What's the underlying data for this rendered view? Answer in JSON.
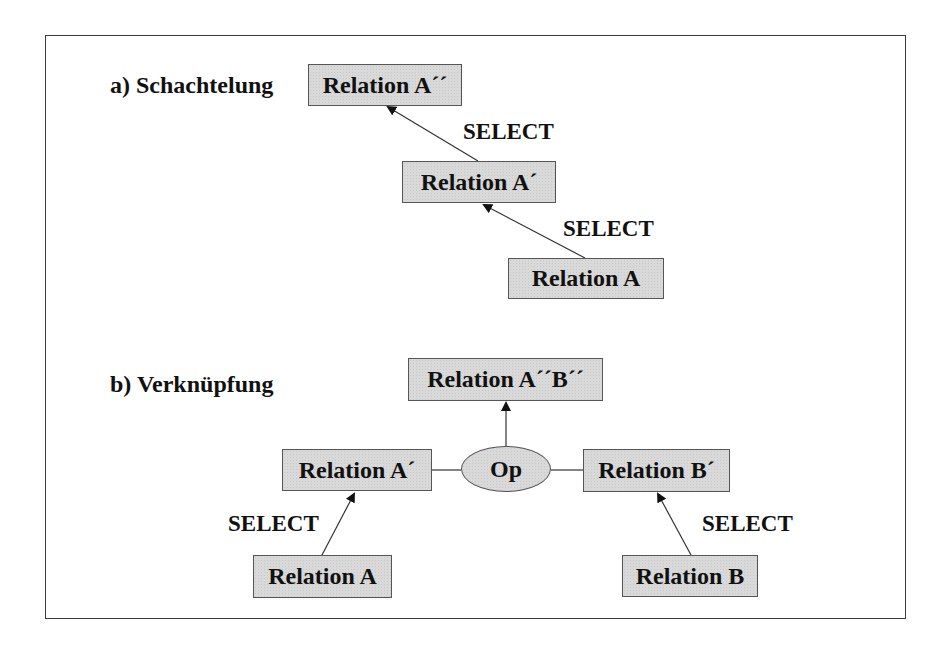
{
  "section_a": {
    "title": "a) Schachtelung",
    "nodes": {
      "a_dd": "Relation A´´",
      "a_d": "Relation A´",
      "a": "Relation A"
    },
    "edges": [
      {
        "from": "Relation A´",
        "to": "Relation A´´",
        "label": "SELECT"
      },
      {
        "from": "Relation A",
        "to": "Relation A´",
        "label": "SELECT"
      }
    ],
    "labels": {
      "select_upper": "SELECT",
      "select_lower": "SELECT"
    }
  },
  "section_b": {
    "title": "b) Verknüpfung",
    "nodes": {
      "result": "Relation A´´B´´",
      "a_d": "Relation A´",
      "op": "Op",
      "b_d": "Relation B´",
      "a": "Relation A",
      "b": "Relation B"
    },
    "edges": [
      {
        "from": "Op",
        "to": "Relation A´´B´´",
        "label": ""
      },
      {
        "from": "Relation A´",
        "to": "Op",
        "label": ""
      },
      {
        "from": "Relation B´",
        "to": "Op",
        "label": ""
      },
      {
        "from": "Relation A",
        "to": "Relation A´",
        "label": "SELECT"
      },
      {
        "from": "Relation B",
        "to": "Relation B´",
        "label": "SELECT"
      }
    ],
    "labels": {
      "select_left": "SELECT",
      "select_right": "SELECT"
    }
  },
  "colors": {
    "node_fill": "#d9d9d9",
    "node_border": "#555555",
    "line": "#333333",
    "text": "#111111"
  }
}
